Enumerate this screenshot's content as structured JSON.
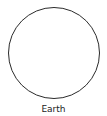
{
  "diagram": {
    "shape": "circle",
    "label": "Earth",
    "stroke_color": "#2b2b2b",
    "fill_color": "#ffffff"
  }
}
